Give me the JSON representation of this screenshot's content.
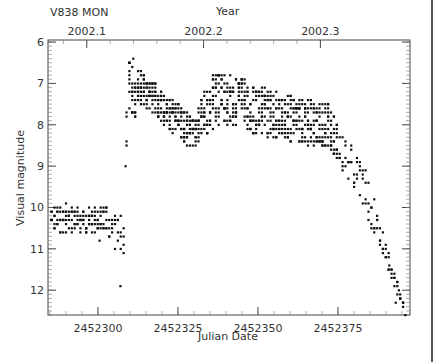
{
  "chart_data": {
    "type": "scatter",
    "title": "V838 MON",
    "xlabel": "Julian Date",
    "ylabel": "Visual magnitude",
    "top_axis_label": "Year",
    "xlim": [
      2452284.4,
      2452397.5
    ],
    "ylim": [
      12.6,
      5.95
    ],
    "y_inverted": true,
    "x_ticks": [
      2452300,
      2452325,
      2452350,
      2452375
    ],
    "x_tick_labels": [
      "2452300",
      "2452325",
      "2452350",
      "2452375"
    ],
    "y_ticks": [
      6,
      7,
      8,
      9,
      10,
      11,
      12
    ],
    "y_tick_labels": [
      "6",
      "7",
      "8",
      "9",
      "10",
      "11",
      "12"
    ],
    "top_ticks_jd": [
      2452296.5,
      2452333.0,
      2452369.5
    ],
    "top_tick_labels": [
      "2002.1",
      "2002.2",
      "2002.3"
    ],
    "grid": false,
    "legend": null,
    "series": [
      {
        "name": "V838 Mon visual estimates",
        "segments": [
          {
            "desc": "pre-outburst plateau",
            "jd_range": [
              2452285,
              2452303
            ],
            "mag_range": [
              9.9,
              10.8
            ],
            "typical": 10.4
          },
          {
            "desc": "decline before 2nd rise",
            "jd_range": [
              2452303,
              2452308
            ],
            "mag_range": [
              10.2,
              11.9
            ]
          },
          {
            "desc": "rapid rise",
            "jd_range": [
              2452308,
              2452310
            ],
            "mag_range": [
              6.9,
              9.0
            ]
          },
          {
            "desc": "first peak",
            "jd": 2452311,
            "mag": 6.4
          },
          {
            "desc": "decline after first peak",
            "jd_range": [
              2452311,
              2452330
            ],
            "mag_range": [
              6.5,
              8.9
            ],
            "typical_end": 8.3
          },
          {
            "desc": "second maximum",
            "jd_range": [
              2452335,
              2452345
            ],
            "mag_range": [
              6.8,
              8.0
            ],
            "peak": 6.8
          },
          {
            "desc": "plateau/slow fade",
            "jd_range": [
              2452345,
              2452375
            ],
            "mag_range": [
              7.2,
              8.6
            ]
          },
          {
            "desc": "steep final decline",
            "jd_range": [
              2452375,
              2452396
            ],
            "mag_range": [
              8.4,
              12.6
            ]
          }
        ]
      }
    ]
  },
  "plot": {
    "title": "V838 MON",
    "top_axis_title": "Year",
    "x_axis_title": "Julian Date",
    "y_axis_title": "Visual magnitude"
  }
}
